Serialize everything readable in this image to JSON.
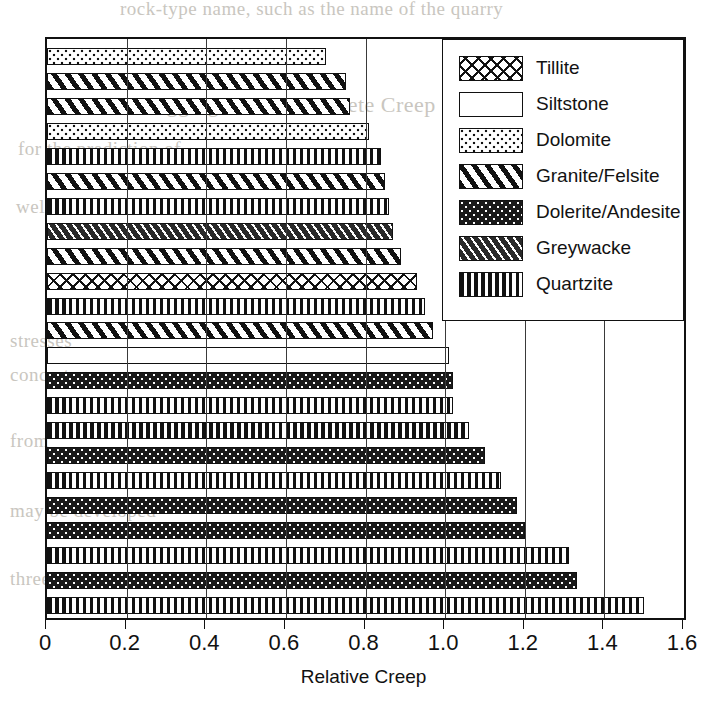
{
  "chart_data": {
    "type": "bar",
    "orientation": "horizontal",
    "title": "",
    "xlabel": "Relative Creep",
    "ylabel": "",
    "xlim": [
      0,
      1.6
    ],
    "xticks": [
      "0",
      "0.2",
      "0.4",
      "0.6",
      "0.8",
      "1.0",
      "1.2",
      "1.4",
      "1.6"
    ],
    "xtick_values": [
      0,
      0.2,
      0.4,
      0.6,
      0.8,
      1.0,
      1.2,
      1.4,
      1.6
    ],
    "grid": "vertical",
    "legend_position": "top-right",
    "legend": [
      {
        "label": "Tillite",
        "pattern": "crosshatch"
      },
      {
        "label": "Siltstone",
        "pattern": "blank"
      },
      {
        "label": "Dolomite",
        "pattern": "fine-dots-light"
      },
      {
        "label": "Granite/Felsite",
        "pattern": "diagonal-stripes"
      },
      {
        "label": "Dolerite/Andesite",
        "pattern": "solid-black-dots"
      },
      {
        "label": "Greywacke",
        "pattern": "dark-diagonal-hatch"
      },
      {
        "label": "Quartzite",
        "pattern": "vertical-stripes"
      }
    ],
    "bars": [
      {
        "series": "Dolomite",
        "value": 0.7
      },
      {
        "series": "Granite/Felsite",
        "value": 0.75
      },
      {
        "series": "Granite/Felsite",
        "value": 0.76
      },
      {
        "series": "Dolomite",
        "value": 0.81
      },
      {
        "series": "Quartzite",
        "value": 0.84
      },
      {
        "series": "Granite/Felsite",
        "value": 0.85
      },
      {
        "series": "Quartzite",
        "value": 0.86
      },
      {
        "series": "Greywacke",
        "value": 0.87
      },
      {
        "series": "Granite/Felsite",
        "value": 0.89
      },
      {
        "series": "Tillite",
        "value": 0.93
      },
      {
        "series": "Quartzite",
        "value": 0.95
      },
      {
        "series": "Granite/Felsite",
        "value": 0.97
      },
      {
        "series": "Siltstone",
        "value": 1.01
      },
      {
        "series": "Dolerite/Andesite",
        "value": 1.02
      },
      {
        "series": "Quartzite",
        "value": 1.02
      },
      {
        "series": "Quartzite",
        "value": 1.06
      },
      {
        "series": "Dolerite/Andesite",
        "value": 1.1
      },
      {
        "series": "Quartzite",
        "value": 1.14
      },
      {
        "series": "Dolerite/Andesite",
        "value": 1.18
      },
      {
        "series": "Dolerite/Andesite",
        "value": 1.2
      },
      {
        "series": "Quartzite",
        "value": 1.31
      },
      {
        "series": "Dolerite/Andesite",
        "value": 1.33
      },
      {
        "series": "Quartzite",
        "value": 1.5
      }
    ]
  },
  "page_bleed": [
    {
      "text": "rock-type name, such as the name of the quarry",
      "x": 120,
      "y": 2
    },
    {
      "text": "Aggregate and Concrete Creep",
      "x": 150,
      "y": 94
    },
    {
      "text": "for the",
      "x": 20,
      "y": 140
    },
    {
      "text": "prediction",
      "x": 18,
      "y": 168
    },
    {
      "text": "of",
      "x": 30,
      "y": 196
    },
    {
      "text": "well",
      "x": 22,
      "y": 232
    },
    {
      "text": "stresses",
      "x": 12,
      "y": 330
    },
    {
      "text": "of",
      "x": 25,
      "y": 364
    },
    {
      "text": "concrete",
      "x": 14,
      "y": 396
    },
    {
      "text": "from",
      "x": 20,
      "y": 430
    },
    {
      "text": "to that",
      "x": 14,
      "y": 466
    },
    {
      "text": "may be developed",
      "x": 10,
      "y": 500
    },
    {
      "text": "values are related",
      "x": 10,
      "y": 534
    },
    {
      "text": "three",
      "x": 18,
      "y": 568
    }
  ]
}
